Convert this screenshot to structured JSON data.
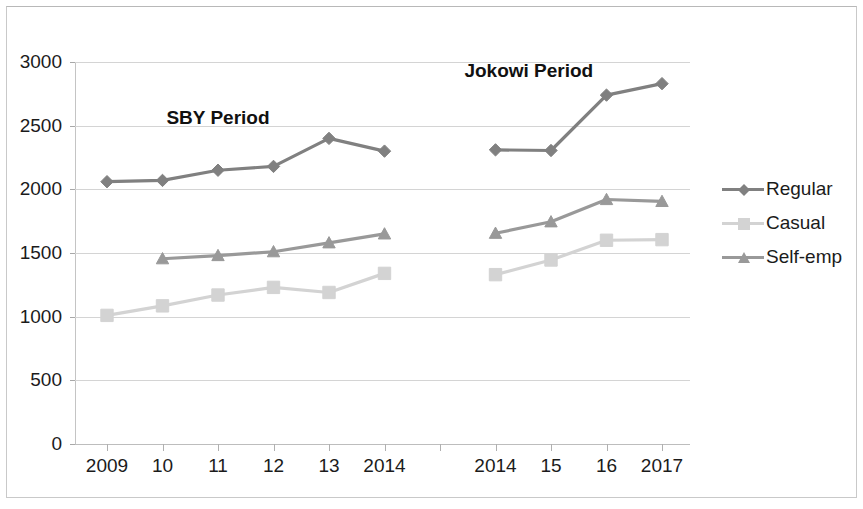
{
  "chart_data": {
    "type": "line",
    "title": "",
    "xlabel": "",
    "ylabel": "",
    "ylim": [
      0,
      3000
    ],
    "y_ticks": [
      0,
      500,
      1000,
      1500,
      2000,
      2500,
      3000
    ],
    "y_tick_labels": [
      "0",
      "500",
      "1000",
      "1500",
      "2000",
      "2500",
      "3000"
    ],
    "grid": true,
    "legend_position": "right",
    "categories": [
      "2009",
      "10",
      "11",
      "12",
      "13",
      "2014",
      "",
      "2014",
      "15",
      "16",
      "2017"
    ],
    "x_tick_labels": [
      "2009",
      "10",
      "11",
      "12",
      "13",
      "2014",
      "",
      "2014",
      "15",
      "16",
      "2017"
    ],
    "series": [
      {
        "name": "Regular",
        "color": "#808080",
        "marker": "diamond",
        "values": [
          2060,
          2070,
          2150,
          2180,
          2400,
          2300,
          null,
          2310,
          2305,
          2740,
          2830
        ]
      },
      {
        "name": "Casual",
        "color": "#d3d3d3",
        "marker": "square",
        "values": [
          1010,
          1085,
          1170,
          1230,
          1190,
          1340,
          null,
          1330,
          1445,
          1600,
          1605
        ]
      },
      {
        "name": "Self-emp",
        "color": "#999999",
        "marker": "triangle",
        "values": [
          null,
          1455,
          1480,
          1510,
          1580,
          1650,
          null,
          1655,
          1745,
          1920,
          1905
        ]
      }
    ],
    "annotations": [
      {
        "text": "SBY Period",
        "x_index": 2,
        "y_value": 2560
      },
      {
        "text": "Jokowi Period",
        "x_index": 7.6,
        "y_value": 2930
      }
    ]
  },
  "legend": {
    "items": [
      {
        "label": "Regular",
        "color": "#808080",
        "marker": "diamond"
      },
      {
        "label": "Casual",
        "color": "#d3d3d3",
        "marker": "square"
      },
      {
        "label": "Self-emp",
        "color": "#999999",
        "marker": "triangle"
      }
    ]
  }
}
